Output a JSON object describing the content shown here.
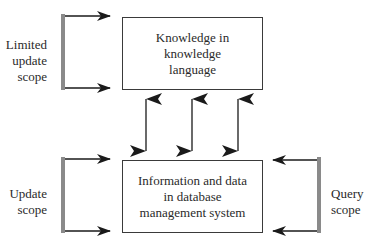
{
  "diagram": {
    "boxes": {
      "knowledge": {
        "lines": [
          "Knowledge in",
          "knowledge",
          "language"
        ]
      },
      "database": {
        "lines": [
          "Information and data",
          "in database",
          "management system"
        ]
      }
    },
    "scopes": {
      "limited_update": {
        "lines": [
          "Limited",
          "update",
          "scope"
        ]
      },
      "update": {
        "lines": [
          "Update",
          "scope"
        ]
      },
      "query": {
        "lines": [
          "Query",
          "scope"
        ]
      }
    },
    "connectors": {
      "bidirectional_count": 3
    },
    "colors": {
      "stroke": "#2a2a2a",
      "bracket": "#8a8a8a",
      "box_border": "#3a3a3a"
    }
  }
}
